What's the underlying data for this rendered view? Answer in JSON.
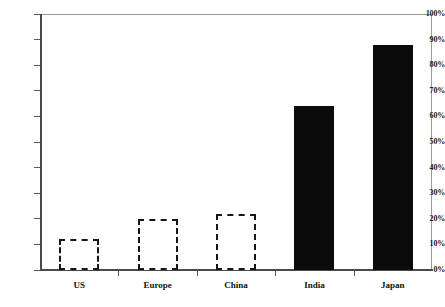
{
  "chart_data": {
    "type": "bar",
    "title": "",
    "subtitle": "",
    "xlabel": "",
    "ylabel": "",
    "categories": [
      "US",
      "Europe",
      "China",
      "India",
      "Japan"
    ],
    "values": [
      12,
      20,
      22,
      64,
      88
    ],
    "value_unit": "%",
    "ylim": [
      0,
      100
    ],
    "ytick_values": [
      0,
      10,
      20,
      30,
      40,
      50,
      60,
      70,
      80,
      90,
      100
    ],
    "ytick_labels": [
      "0%",
      "10%",
      "20%",
      "30%",
      "40%",
      "50%",
      "60%",
      "70%",
      "80%",
      "90%",
      "100%"
    ],
    "grid": false,
    "legend": null,
    "series": [
      {
        "name": "",
        "values": [
          12,
          20,
          22,
          64,
          88
        ],
        "styles": [
          "outlined",
          "outlined",
          "outlined",
          "filled",
          "filled"
        ]
      }
    ],
    "bar_fill_color": "#0b0b0b",
    "bar_outline_color": "#161616",
    "bar_outline_fill": "#ffffff",
    "axis_color": "#4a4a4a",
    "frame_color": "#8a8a8a",
    "background_color": "#ffffff",
    "annotations": []
  }
}
